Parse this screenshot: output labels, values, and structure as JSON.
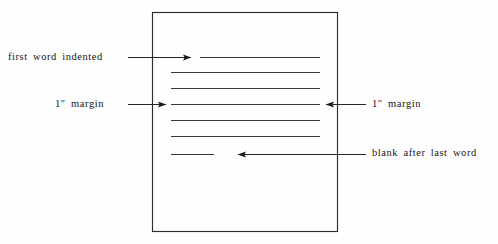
{
  "diagram": {
    "colors": {
      "ink": "#1a1a1f",
      "page_border": "#2b2b30",
      "text_line": "#3a3a40",
      "background": "#fefefe"
    },
    "page": {
      "name": "manuscript page",
      "x": 152,
      "y": 12,
      "width": 186,
      "height": 220
    },
    "text_lines": [
      {
        "name": "line-1-indented",
        "x1": 200,
        "x2": 320,
        "y": 57,
        "indented": true
      },
      {
        "name": "line-2",
        "x1": 171,
        "x2": 320,
        "y": 72,
        "indented": false
      },
      {
        "name": "line-3",
        "x1": 171,
        "x2": 320,
        "y": 88,
        "indented": false
      },
      {
        "name": "line-4",
        "x1": 171,
        "x2": 320,
        "y": 104,
        "indented": false
      },
      {
        "name": "line-5",
        "x1": 171,
        "x2": 320,
        "y": 120,
        "indented": false
      },
      {
        "name": "line-6",
        "x1": 171,
        "x2": 320,
        "y": 136,
        "indented": false
      },
      {
        "name": "line-7-short",
        "x1": 171,
        "x2": 214,
        "y": 154,
        "indented": false
      }
    ],
    "annotations": [
      {
        "id": "first-word-indented",
        "label": "first word indented",
        "side": "left",
        "arrow_direction": "right",
        "leader": {
          "x1": 128,
          "x2": 197,
          "y": 57
        },
        "tip": {
          "x": 197,
          "y": 57
        }
      },
      {
        "id": "margin-left",
        "label": "1″ margin",
        "side": "left",
        "arrow_direction": "right",
        "leader": {
          "x1": 128,
          "x2": 172,
          "y": 104
        },
        "tip": {
          "x": 172,
          "y": 104
        }
      },
      {
        "id": "margin-right",
        "label": "1″ margin",
        "side": "right",
        "arrow_direction": "left",
        "leader": {
          "x1": 366,
          "x2": 320,
          "y": 104
        },
        "tip": {
          "x": 320,
          "y": 104
        }
      },
      {
        "id": "blank-after-last-word",
        "label": "blank after last word",
        "side": "right",
        "arrow_direction": "left",
        "leader": {
          "x1": 366,
          "x2": 232,
          "y": 154
        },
        "tip": {
          "x": 232,
          "y": 154
        }
      }
    ]
  }
}
